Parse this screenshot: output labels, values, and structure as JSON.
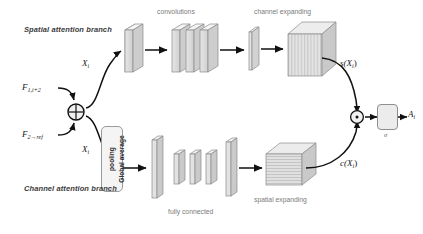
{
  "figure": {
    "type": "neural-network-architecture-diagram"
  },
  "branches": {
    "spatial": {
      "title": "Spatial attention branch"
    },
    "channel": {
      "title": "Channel attention branch"
    }
  },
  "inputs": {
    "top": {
      "base": "F",
      "sub": "1,i+2"
    },
    "bottom": {
      "base": "F",
      "sub": "2→ref"
    }
  },
  "nodes": {
    "sum": {
      "symbol": "+",
      "name": "element-wise-addition"
    },
    "product": {
      "symbol": "·",
      "name": "element-wise-multiplication"
    }
  },
  "signals": {
    "x_top": {
      "base": "X",
      "sub": "i"
    },
    "x_bottom": {
      "base": "X",
      "sub": "i"
    },
    "spatial_out": {
      "text": "s(X",
      "sub": "i",
      "tail": ")"
    },
    "channel_out": {
      "text": "c(X",
      "sub": "i",
      "tail": ")"
    },
    "output": {
      "base": "A",
      "sub": "i"
    }
  },
  "stage_captions": {
    "convolutions": "convolutions",
    "channel_expanding": "channel expanding",
    "fully_connected": "fully connected",
    "spatial_expanding": "spatial expanding"
  },
  "blocks": {
    "global_average_pooling": {
      "label": "Global average\npooling",
      "line1": "Global average",
      "line2": "pooling"
    },
    "sigmoid": {
      "label": "σ",
      "name": "sigmoid-activation"
    }
  },
  "colors": {
    "slab_face": "#d8d8d8",
    "slab_top": "#eeeeee",
    "slab_side": "#bfbfbf",
    "stroke": "#8a8a8a",
    "arrow": "#111111",
    "text_caption": "#7b7b7b",
    "text_title": "#3b3b3b",
    "background": "#ffffff"
  }
}
